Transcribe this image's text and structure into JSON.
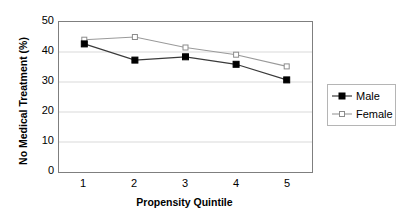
{
  "chart_data": {
    "type": "line",
    "title": "",
    "xlabel": "Propensity Quintile",
    "ylabel": "No Medical Treatment (%)",
    "categories": [
      "1",
      "2",
      "3",
      "4",
      "5"
    ],
    "x": [
      1,
      2,
      3,
      4,
      5
    ],
    "xlim": [
      0.5,
      5.5
    ],
    "ylim": [
      0,
      50
    ],
    "yticks": [
      0,
      10,
      20,
      30,
      40,
      50
    ],
    "ytick_labels": [
      "0",
      "10",
      "20",
      "30",
      "40",
      "50"
    ],
    "grid": "horizontal",
    "legend_position": "right",
    "series": [
      {
        "name": "Male",
        "values": [
          42.7,
          37.3,
          38.4,
          35.9,
          30.7
        ],
        "color": "#000000",
        "marker": "filled-square"
      },
      {
        "name": "Female",
        "values": [
          44.1,
          45.0,
          41.5,
          39.1,
          35.2
        ],
        "color": "#9a9a9a",
        "marker": "open-square"
      }
    ]
  },
  "axes": {
    "y_title": "No Medical Treatment (%)",
    "x_title": "Propensity Quintile",
    "y_tick_labels": [
      "50",
      "40",
      "30",
      "20",
      "10",
      "0"
    ],
    "x_tick_labels": [
      "1",
      "2",
      "3",
      "4",
      "5"
    ]
  },
  "legend": {
    "entries": [
      {
        "label": "Male"
      },
      {
        "label": "Female"
      }
    ]
  },
  "colors": {
    "male_line": "#000000",
    "female_line": "#9a9a9a",
    "gridline": "#d9d9d9",
    "plot_border": "#7f7f7f",
    "legend_border": "#b5b5b5",
    "background": "#ffffff"
  }
}
